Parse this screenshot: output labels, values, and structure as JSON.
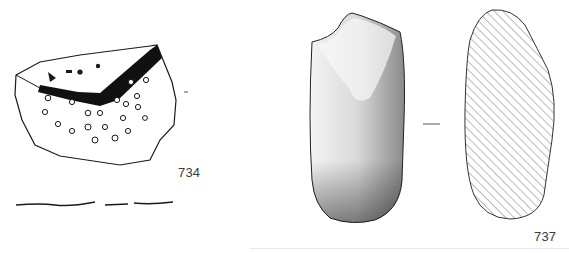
{
  "plate": {
    "figures": [
      {
        "number": "734",
        "description": "Fragment with perforations and dark band (drawing)"
      },
      {
        "number": "737",
        "description": "Stone axe / pestle, front view and hatched cross-section"
      }
    ]
  },
  "colors": {
    "ink": "#1a1a1a",
    "hatch": "#555555",
    "background": "#ffffff"
  }
}
